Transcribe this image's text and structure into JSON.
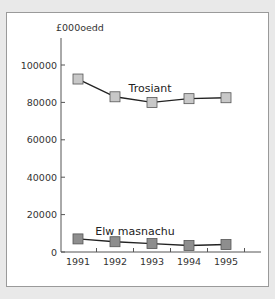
{
  "chart_data": {
    "type": "line",
    "title": "",
    "ylabel": "£000oedd",
    "xlabel": "",
    "categories": [
      "1991",
      "1992",
      "1993",
      "1994",
      "1995"
    ],
    "yticks": [
      0,
      20000,
      40000,
      60000,
      80000,
      100000
    ],
    "ytick_labels": [
      "0",
      "20000",
      "40000",
      "60000",
      "80000",
      "100000"
    ],
    "ylim": [
      0,
      110000
    ],
    "grid": false,
    "legend": "inline labels",
    "series": [
      {
        "name": "Trosiant",
        "values": [
          92500,
          83000,
          80000,
          82000,
          82500
        ],
        "marker": "square",
        "marker_color": "#c8c8c8"
      },
      {
        "name": "Elw masnachu",
        "values": [
          7000,
          5500,
          4500,
          3500,
          4000
        ],
        "marker": "square",
        "marker_color": "#8e8e8e"
      }
    ]
  }
}
